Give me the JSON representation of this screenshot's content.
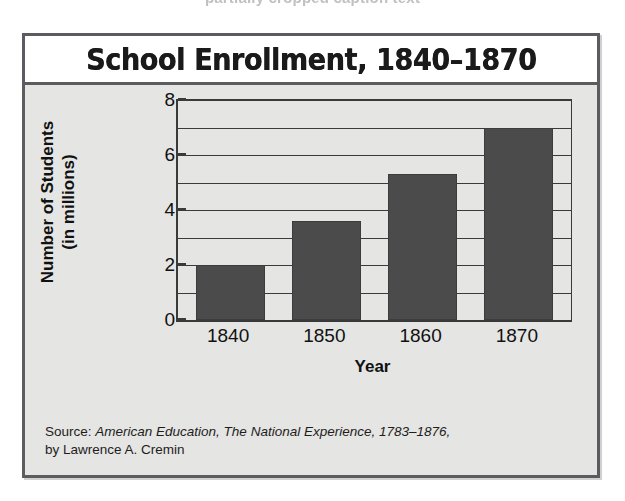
{
  "top_caption": "partially cropped caption text",
  "figure": {
    "title": "School Enrollment, 1840–1870",
    "source": {
      "prefix": "Source:",
      "book_title": "American Education, The National Experience, 1783–1876,",
      "author": "by Lawrence A. Cremin"
    }
  },
  "chart_data": {
    "type": "bar",
    "title": "School Enrollment, 1840–1870",
    "categories": [
      "1840",
      "1850",
      "1860",
      "1870"
    ],
    "values": [
      2.0,
      3.6,
      5.3,
      7.0
    ],
    "xlabel": "Year",
    "ylabel": "Number of Students\n(in millions)",
    "ylabel_line1": "Number of Students",
    "ylabel_line2": "(in millions)",
    "ylim": [
      0,
      8
    ],
    "ytick_labels": [
      "0",
      "2",
      "4",
      "6",
      "8"
    ],
    "ytick_values": [
      0,
      2,
      4,
      6,
      8
    ],
    "gridline_values": [
      1,
      2,
      3,
      4,
      5,
      6,
      7,
      8
    ],
    "grid": true,
    "legend": false,
    "bar_color": "#4b4b4b",
    "axis_color": "#3a3a3a",
    "panel_color": "#e5e5e3",
    "title_band_color": "#ffffff",
    "frame_color": "#5c5c60"
  }
}
